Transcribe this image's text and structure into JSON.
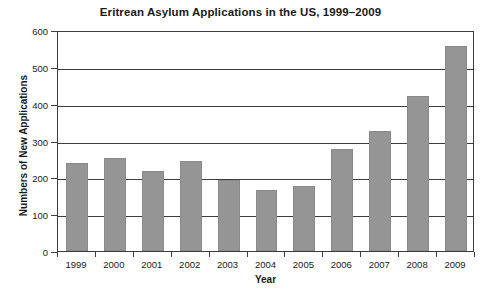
{
  "chart_data": {
    "type": "bar",
    "title": "Eritrean Asylum Applications in the US, 1999–2009",
    "xlabel": "Year",
    "ylabel": "Numbers of New Applications",
    "categories": [
      "1999",
      "2000",
      "2001",
      "2002",
      "2003",
      "2004",
      "2005",
      "2006",
      "2007",
      "2008",
      "2009"
    ],
    "values": [
      238,
      252,
      216,
      245,
      193,
      167,
      177,
      278,
      326,
      420,
      557
    ],
    "ylim": [
      0,
      600
    ],
    "yticks": [
      0,
      100,
      200,
      300,
      400,
      500,
      600
    ],
    "ytick_labels": [
      "0",
      "100",
      "200",
      "300",
      "400",
      "500",
      "600"
    ],
    "grid": "horizontal",
    "legend": "none",
    "bar_color": "#959595",
    "axis_color": "#3d3d3d",
    "background_color": "#ffffff",
    "text_color": "#1a1a1a"
  }
}
